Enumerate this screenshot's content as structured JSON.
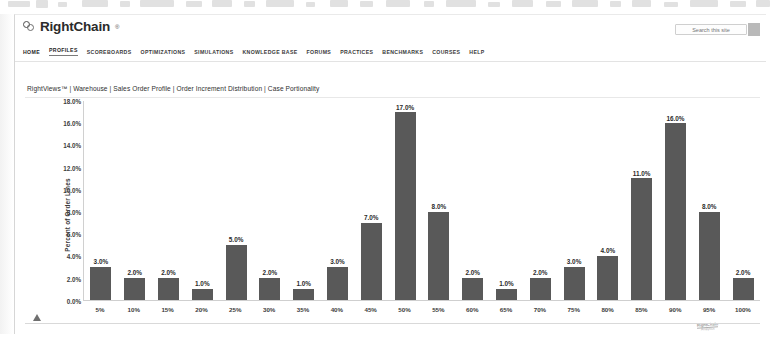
{
  "site": {
    "brand_name": "RightChain",
    "brand_tm": "®",
    "search_placeholder": "Search this site",
    "search_value": "",
    "nav_items": [
      {
        "label": "HOME",
        "active": false
      },
      {
        "label": "PROFILES",
        "active": true
      },
      {
        "label": "SCOREBOARDS",
        "active": false
      },
      {
        "label": "OPTIMIZATIONS",
        "active": false
      },
      {
        "label": "SIMULATIONS",
        "active": false
      },
      {
        "label": "KNOWLEDGE BASE",
        "active": false
      },
      {
        "label": "FORUMS",
        "active": false
      },
      {
        "label": "PRACTICES",
        "active": false
      },
      {
        "label": "BENCHMARKS",
        "active": false
      },
      {
        "label": "COURSES",
        "active": false
      },
      {
        "label": "HELP",
        "active": false
      }
    ],
    "breadcrumb": "RightViews™ | Warehouse | Sales Order Profile | Order Increment Distribution | Case Portionality",
    "watermark_main": "RightChain",
    "watermark_sub": "Analytics"
  },
  "chart_data": {
    "type": "bar",
    "title": "",
    "xlabel": "",
    "ylabel": "Percent of Order Lines",
    "ylim": [
      0,
      18
    ],
    "ytick_labels": [
      "18.0%",
      "16.0%",
      "14.0%",
      "12.0%",
      "10.0%",
      "8.0%",
      "6.0%",
      "4.0%",
      "2.0%",
      "0.0%"
    ],
    "ytick_values": [
      18,
      16,
      14,
      12,
      10,
      8,
      6,
      4,
      2,
      0
    ],
    "grid": false,
    "legend": "none",
    "bar_color": "#595959",
    "categories": [
      "5%",
      "10%",
      "15%",
      "20%",
      "25%",
      "30%",
      "35%",
      "40%",
      "45%",
      "50%",
      "55%",
      "60%",
      "65%",
      "70%",
      "75%",
      "80%",
      "85%",
      "90%",
      "95%",
      "100%"
    ],
    "values": [
      3.0,
      2.0,
      2.0,
      1.0,
      5.0,
      2.0,
      1.0,
      3.0,
      7.0,
      17.0,
      8.0,
      2.0,
      1.0,
      2.0,
      3.0,
      4.0,
      11.0,
      16.0,
      8.0,
      2.0
    ],
    "data_labels": [
      "3.0%",
      "2.0%",
      "2.0%",
      "1.0%",
      "5.0%",
      "2.0%",
      "1.0%",
      "3.0%",
      "7.0%",
      "17.0%",
      "8.0%",
      "2.0%",
      "1.0%",
      "2.0%",
      "3.0%",
      "4.0%",
      "11.0%",
      "16.0%",
      "8.0%",
      "2.0%"
    ]
  }
}
